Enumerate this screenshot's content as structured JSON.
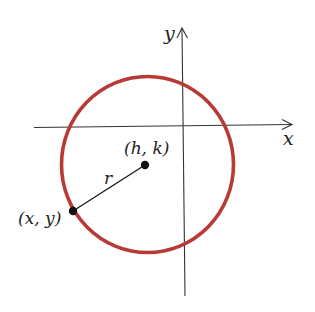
{
  "figure": {
    "colors": {
      "circle": "#b83a36",
      "axes": "#333333",
      "points": "#111111",
      "text": "#222222",
      "background": "#ffffff"
    },
    "axes": {
      "x_label": "x",
      "y_label": "y"
    },
    "circle": {
      "center_label": "(h, k)",
      "point_label": "(x, y)",
      "radius_label": "r"
    }
  }
}
